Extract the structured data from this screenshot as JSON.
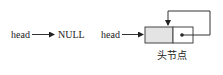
{
  "diagram": {
    "left": {
      "head_label": "head",
      "target_label": "NULL"
    },
    "right": {
      "head_label": "head",
      "node_caption": "头节点"
    },
    "colors": {
      "line": "#333333",
      "data_fill": "#e4e4e4",
      "box_border": "#444444"
    }
  }
}
